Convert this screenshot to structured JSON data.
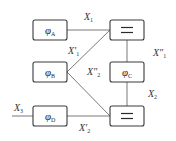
{
  "diagram": {
    "type": "block-diagram",
    "nodes": [
      {
        "id": "A",
        "kind": "function",
        "symbol": "φ",
        "subscript": "A"
      },
      {
        "id": "B",
        "kind": "function",
        "symbol": "φ",
        "subscript": "B"
      },
      {
        "id": "C",
        "kind": "function",
        "symbol": "φ",
        "subscript": "C"
      },
      {
        "id": "D",
        "kind": "function",
        "symbol": "φ",
        "subscript": "D"
      },
      {
        "id": "EQ1",
        "kind": "equality",
        "symbol": "="
      },
      {
        "id": "EQ2",
        "kind": "equality",
        "symbol": "="
      }
    ],
    "edges": [
      {
        "from": "A",
        "to": "EQ1",
        "label": "X",
        "subscript": "1",
        "primes": ""
      },
      {
        "from": "B",
        "to": "EQ1",
        "label": "X",
        "subscript": "1",
        "primes": "′"
      },
      {
        "from": "EQ1",
        "to": "C",
        "label": "X",
        "subscript": "1",
        "primes": "″"
      },
      {
        "from": "B",
        "to": "EQ2",
        "label": "X",
        "subscript": "2",
        "primes": "″"
      },
      {
        "from": "C",
        "to": "EQ2",
        "label": "X",
        "subscript": "2",
        "primes": ""
      },
      {
        "from": "D",
        "to": "EQ2",
        "label": "X",
        "subscript": "2",
        "primes": "′"
      },
      {
        "from": "input",
        "to": "D",
        "label": "X",
        "subscript": "3",
        "primes": ""
      }
    ]
  },
  "labels": {
    "phiA": {
      "main": "φ",
      "sub": "A"
    },
    "phiB": {
      "main": "φ",
      "sub": "B"
    },
    "phiC": {
      "main": "φ",
      "sub": "C"
    },
    "phiD": {
      "main": "φ",
      "sub": "D"
    },
    "x1": {
      "main": "X",
      "sub": "1"
    },
    "x1p": {
      "main": "X′",
      "sub": "1"
    },
    "x1pp": {
      "main": "X″",
      "sub": "1"
    },
    "x2pp": {
      "main": "X″",
      "sub": "2"
    },
    "x2": {
      "main": "X",
      "sub": "2"
    },
    "x2p": {
      "main": "X′",
      "sub": "2"
    },
    "x3": {
      "main": "X",
      "sub": "3"
    }
  }
}
